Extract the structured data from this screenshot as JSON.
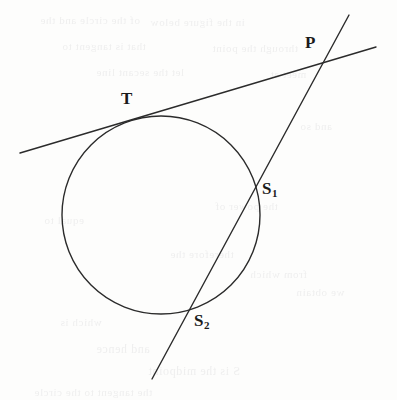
{
  "figure": {
    "background_color": "#fdfdfc",
    "ink_color": "#2b2b2b",
    "stroke_width": 1.4
  },
  "labels": {
    "tangent_point": {
      "text": "T",
      "x": 121,
      "y": 90
    },
    "external_point": {
      "text": "P",
      "x": 305,
      "y": 34
    },
    "near_secant_point": {
      "text": "S",
      "subscript": "1",
      "x": 262,
      "y": 180
    },
    "far_secant_point": {
      "text": "S",
      "subscript": "2",
      "x": 194,
      "y": 312
    }
  },
  "geometry": {
    "circle": {
      "cx": 161,
      "cy": 215,
      "r": 99
    },
    "tangent_line": {
      "x1": 20,
      "y1": 153,
      "x2": 376,
      "y2": 47
    },
    "secant_line": {
      "x1": 152,
      "y1": 379,
      "x2": 349,
      "y2": 15
    },
    "points": {
      "T": {
        "x": 135,
        "y": 117
      },
      "P": {
        "x": 322,
        "y": 58
      },
      "S1": {
        "x": 256,
        "y": 188
      },
      "S2": {
        "x": 190,
        "y": 310
      }
    }
  },
  "ghost_text": {
    "lines": [
      {
        "text": "of the circle and the",
        "x": 40,
        "y": 14,
        "size": 11
      },
      {
        "text": "in the figure below",
        "x": 150,
        "y": 16,
        "size": 11
      },
      {
        "text": "that is tangent to",
        "x": 62,
        "y": 40,
        "size": 11
      },
      {
        "text": "through the point",
        "x": 212,
        "y": 42,
        "size": 11
      },
      {
        "text": "let the secant line",
        "x": 96,
        "y": 66,
        "size": 11
      },
      {
        "text": "meet at",
        "x": 270,
        "y": 68,
        "size": 11
      },
      {
        "text": "and so",
        "x": 300,
        "y": 120,
        "size": 11
      },
      {
        "text": "the power of",
        "x": 215,
        "y": 200,
        "size": 11
      },
      {
        "text": "equal to",
        "x": 44,
        "y": 214,
        "size": 11
      },
      {
        "text": "therefore the",
        "x": 170,
        "y": 248,
        "size": 11
      },
      {
        "text": "from which",
        "x": 250,
        "y": 268,
        "size": 11
      },
      {
        "text": "we obtain",
        "x": 296,
        "y": 286,
        "size": 11
      },
      {
        "text": "which is",
        "x": 60,
        "y": 316,
        "size": 11
      },
      {
        "text": "and hence",
        "x": 96,
        "y": 342,
        "size": 12
      },
      {
        "text": "S is the midpoint",
        "x": 148,
        "y": 364,
        "size": 12
      },
      {
        "text": "the tangent to the circle",
        "x": 34,
        "y": 386,
        "size": 11
      }
    ]
  }
}
